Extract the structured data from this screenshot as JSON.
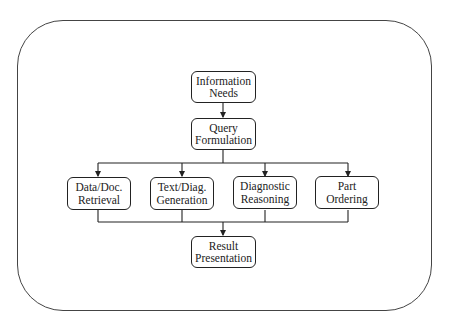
{
  "diagram": {
    "nodes": {
      "information_needs": "Information\nNeeds",
      "query_formulation": "Query\nFormulation",
      "data_doc_retrieval": "Data/Doc.\nRetrieval",
      "text_diag_generation": "Text/Diag.\nGeneration",
      "diagnostic_reasoning": "Diagnostic\nReasoning",
      "part_ordering": "Part\nOrdering",
      "result_presentation": "Result\nPresentation"
    },
    "edges": [
      {
        "from": "information_needs",
        "to": "query_formulation"
      },
      {
        "from": "query_formulation",
        "to": "data_doc_retrieval"
      },
      {
        "from": "query_formulation",
        "to": "text_diag_generation"
      },
      {
        "from": "query_formulation",
        "to": "diagnostic_reasoning"
      },
      {
        "from": "query_formulation",
        "to": "part_ordering"
      },
      {
        "from": "data_doc_retrieval",
        "to": "result_presentation"
      },
      {
        "from": "text_diag_generation",
        "to": "result_presentation"
      },
      {
        "from": "diagnostic_reasoning",
        "to": "result_presentation"
      },
      {
        "from": "part_ordering",
        "to": "result_presentation"
      }
    ],
    "colors": {
      "stroke": "#222222",
      "background": "#ffffff"
    }
  }
}
